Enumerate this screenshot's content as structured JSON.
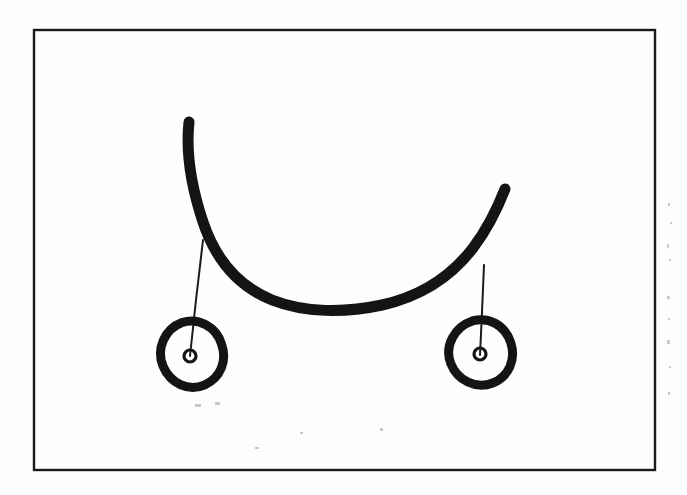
{
  "document": {
    "kind": "scanned-hand-drawn-diagram",
    "title": "Hand-drawn sketch of a hanging curved cable with two suspended ring pendants",
    "background_color": "#fefefe",
    "ink_color": "#151515",
    "page_width": 687,
    "page_height": 495,
    "visible_text": ""
  },
  "frame": {
    "label": "rectangular-border",
    "x": 34,
    "y": 30,
    "width": 621,
    "height": 440,
    "stroke_color": "#1a1a1a",
    "stroke_width": 2.4
  },
  "shapes": {
    "arc": {
      "label": "thick-hanging-curve",
      "description": "Thick hand-drawn catenary-like arc sagging downward, open at the top",
      "stroke_color": "#141414",
      "stroke_width": 11,
      "left_end": {
        "x": 189,
        "y": 122
      },
      "right_end": {
        "x": 505,
        "y": 189
      },
      "lowest_point": {
        "x": 352,
        "y": 311
      },
      "path": "M 189 122 C 186 150 190 183 203 222 C 216 261 240 287 272 300 C 305 313 345 313 382 305 C 418 297 450 278 473 248 C 489 227 498 207 505 189"
    },
    "drop_lines": [
      {
        "label": "left-drop-line",
        "stroke_color": "#1a1a1a",
        "stroke_width": 2,
        "from": {
          "x": 203,
          "y": 240
        },
        "to": {
          "x": 190,
          "y": 356
        },
        "path": "M 203 240 L 196 300 L 190 356"
      },
      {
        "label": "right-drop-line",
        "stroke_color": "#1a1a1a",
        "stroke_width": 2,
        "from": {
          "x": 484,
          "y": 265
        },
        "to": {
          "x": 480,
          "y": 355
        },
        "path": "M 484 265 L 482 312 L 480 355"
      }
    ],
    "rings": [
      {
        "label": "left-ring",
        "description": "Irregular thick hand-drawn oval with small circular eyelet inside",
        "stroke_color": "#141414",
        "stroke_width": 9,
        "center": {
          "x": 192,
          "y": 354
        },
        "rx": 31,
        "ry": 33,
        "rotation_deg": -14,
        "outline_path": "M 190 321 C 207 320 222 333 223 351 C 225 369 214 384 197 387 C 179 390 164 377 161 359 C 158 340 172 323 190 321 Z",
        "eyelet": {
          "label": "left-eyelet",
          "center": {
            "x": 190,
            "y": 356
          },
          "radius": 6,
          "stroke_width": 3.2,
          "stroke_color": "#141414"
        }
      },
      {
        "label": "right-ring",
        "description": "Irregular thick hand-drawn oval with small circular eyelet inside",
        "stroke_color": "#141414",
        "stroke_width": 9,
        "center": {
          "x": 480,
          "y": 352
        },
        "rx": 31,
        "ry": 33,
        "rotation_deg": -12,
        "outline_path": "M 479 320 C 496 319 510 331 512 349 C 514 367 503 382 486 385 C 468 388 452 375 449 357 C 446 338 461 322 479 320 Z",
        "eyelet": {
          "label": "right-eyelet",
          "center": {
            "x": 480,
            "y": 354
          },
          "radius": 6,
          "stroke_width": 3.2,
          "stroke_color": "#141414"
        }
      }
    ],
    "scan_artifacts": {
      "label": "scan-speckles",
      "description": "Faint grey specks along the right margin of the scanned page",
      "color": "#c9c9c9",
      "marks": [
        {
          "x": 668,
          "y": 203,
          "w": 2,
          "h": 3
        },
        {
          "x": 670,
          "y": 222,
          "w": 2,
          "h": 2
        },
        {
          "x": 667,
          "y": 244,
          "w": 2,
          "h": 4
        },
        {
          "x": 669,
          "y": 259,
          "w": 2,
          "h": 2
        },
        {
          "x": 667,
          "y": 296,
          "w": 3,
          "h": 3
        },
        {
          "x": 668,
          "y": 318,
          "w": 2,
          "h": 2
        },
        {
          "x": 667,
          "y": 340,
          "w": 3,
          "h": 4
        },
        {
          "x": 669,
          "y": 366,
          "w": 2,
          "h": 2
        },
        {
          "x": 668,
          "y": 392,
          "w": 2,
          "h": 3
        },
        {
          "x": 255,
          "y": 447,
          "w": 4,
          "h": 2
        },
        {
          "x": 300,
          "y": 432,
          "w": 3,
          "h": 2
        },
        {
          "x": 380,
          "y": 428,
          "w": 3,
          "h": 3
        },
        {
          "x": 195,
          "y": 404,
          "w": 6,
          "h": 3
        },
        {
          "x": 215,
          "y": 402,
          "w": 5,
          "h": 3
        }
      ]
    }
  }
}
